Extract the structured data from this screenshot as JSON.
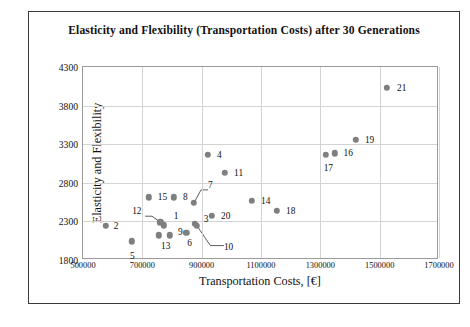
{
  "figure": {
    "title": "Elasticity and Flexibility (Transportation Costs) after 30 Generations",
    "caption": ""
  },
  "chart_data": {
    "type": "scatter",
    "title": "Elasticity and Flexibility (Transportation Costs) after 30 Generations",
    "xlabel": "Transportation Costs, [€]",
    "ylabel": "Elasticity and Flexibility",
    "xlim": [
      500000,
      1700000
    ],
    "ylim": [
      1800,
      4300
    ],
    "xticks": [
      500000,
      700000,
      900000,
      1100000,
      1300000,
      1500000,
      1700000
    ],
    "xticklabels": [
      "500000",
      "700000",
      "900000",
      "1100000",
      "1300000",
      "1500000",
      "1700000"
    ],
    "yticks": [
      1800,
      2300,
      2800,
      3300,
      3800,
      4300
    ],
    "yticklabels": [
      "1800",
      "2300",
      "2800",
      "3300",
      "3800",
      "4300"
    ],
    "grid": true,
    "legend": "none",
    "marker_color": "#7f7f7f",
    "points": [
      {
        "label": "1",
        "x": 772000,
        "y": 2250,
        "lx": 10,
        "ly": -9,
        "leader": false
      },
      {
        "label": "2",
        "x": 577000,
        "y": 2240,
        "lx": 8,
        "ly": 0,
        "leader": false
      },
      {
        "label": "3",
        "x": 877000,
        "y": 2270,
        "lx": 9,
        "ly": -5,
        "leader": false
      },
      {
        "label": "4",
        "x": 921000,
        "y": 3160,
        "lx": 9,
        "ly": 0,
        "leader": false
      },
      {
        "label": "5",
        "x": 665000,
        "y": 2040,
        "lx": -2,
        "ly": 15,
        "leader": false
      },
      {
        "label": "6",
        "x": 848000,
        "y": 2155,
        "lx": 1,
        "ly": 10,
        "leader": false
      },
      {
        "label": "7",
        "x": 874000,
        "y": 2540,
        "lx": 14,
        "ly": -18,
        "leader": true
      },
      {
        "label": "8",
        "x": 807000,
        "y": 2610,
        "lx": 9,
        "ly": 0,
        "leader": false
      },
      {
        "label": "9",
        "x": 793000,
        "y": 2120,
        "lx": 8,
        "ly": -3,
        "leader": false
      },
      {
        "label": "10",
        "x": 884000,
        "y": 2245,
        "lx": 27,
        "ly": 21,
        "leader": true
      },
      {
        "label": "11",
        "x": 979000,
        "y": 2930,
        "lx": 9,
        "ly": 0,
        "leader": false
      },
      {
        "label": "12",
        "x": 760000,
        "y": 2290,
        "lx": -28,
        "ly": -11,
        "leader": true
      },
      {
        "label": "13",
        "x": 756000,
        "y": 2120,
        "lx": 2,
        "ly": 11,
        "leader": false
      },
      {
        "label": "14",
        "x": 1070000,
        "y": 2565,
        "lx": 9,
        "ly": 0,
        "leader": false
      },
      {
        "label": "15",
        "x": 722000,
        "y": 2610,
        "lx": 9,
        "ly": 0,
        "leader": false
      },
      {
        "label": "16",
        "x": 1348000,
        "y": 3180,
        "lx": 9,
        "ly": 0,
        "leader": false
      },
      {
        "label": "17",
        "x": 1318000,
        "y": 3165,
        "lx": -2,
        "ly": 13,
        "leader": false
      },
      {
        "label": "18",
        "x": 1154000,
        "y": 2435,
        "lx": 9,
        "ly": 0,
        "leader": false
      },
      {
        "label": "19",
        "x": 1420000,
        "y": 3355,
        "lx": 9,
        "ly": 0,
        "leader": false
      },
      {
        "label": "20",
        "x": 935000,
        "y": 2375,
        "lx": 9,
        "ly": 0,
        "leader": false
      },
      {
        "label": "21",
        "x": 1525000,
        "y": 4030,
        "lx": 10,
        "ly": 0,
        "leader": false
      }
    ]
  }
}
